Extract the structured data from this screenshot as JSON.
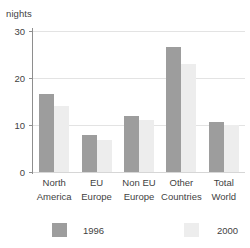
{
  "chart_data": {
    "type": "bar",
    "title": "",
    "xlabel": "",
    "ylabel": "nights",
    "ylim": [
      0,
      30
    ],
    "yticks": [
      0,
      10,
      20,
      30
    ],
    "ytick_labels": [
      "0",
      "10",
      "20",
      "30"
    ],
    "grid": true,
    "legend_position": "bottom",
    "categories": [
      "North America",
      "EU Europe",
      "Non EU Europe",
      "Other Countries",
      "Total World"
    ],
    "category_lines": [
      [
        "North",
        "America"
      ],
      [
        "EU",
        "Europe"
      ],
      [
        "Non EU",
        "Europe"
      ],
      [
        "Other",
        "Countries"
      ],
      [
        "Total",
        "World"
      ]
    ],
    "series": [
      {
        "name": "1996",
        "color": "#9d9d9d",
        "values": [
          16.5,
          7.8,
          12.0,
          26.5,
          10.7
        ]
      },
      {
        "name": "2000",
        "color": "#ededed",
        "values": [
          14.0,
          6.8,
          11.0,
          23.0,
          10.0
        ]
      }
    ]
  },
  "axis": {
    "unit_caption": "nights"
  },
  "legend": {
    "items": [
      {
        "label": "1996"
      },
      {
        "label": "2000"
      }
    ]
  }
}
